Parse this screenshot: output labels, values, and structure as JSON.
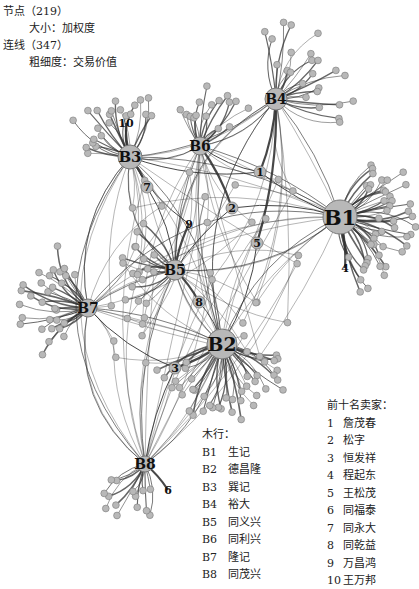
{
  "legend": {
    "nodes_label": "节点（219）",
    "node_size_label": "大小：加权度",
    "edges_label": "连线（347）",
    "edge_width_label": "粗细度：交易价值"
  },
  "firms": {
    "title": "木行：",
    "items": [
      {
        "code": "B1",
        "name": "生记"
      },
      {
        "code": "B2",
        "name": "德昌隆"
      },
      {
        "code": "B3",
        "name": "巽记"
      },
      {
        "code": "B4",
        "name": "裕大"
      },
      {
        "code": "B5",
        "name": "同义兴"
      },
      {
        "code": "B6",
        "name": "同利兴"
      },
      {
        "code": "B7",
        "name": "隆记"
      },
      {
        "code": "B8",
        "name": "同茂兴"
      }
    ]
  },
  "sellers": {
    "title": "前十名卖家：",
    "items": [
      {
        "code": "1",
        "name": "詹茂春"
      },
      {
        "code": "2",
        "name": "松字"
      },
      {
        "code": "3",
        "name": "恒发祥"
      },
      {
        "code": "4",
        "name": "程起东"
      },
      {
        "code": "5",
        "name": "王松茂"
      },
      {
        "code": "6",
        "name": "同福泰"
      },
      {
        "code": "7",
        "name": "同永大"
      },
      {
        "code": "8",
        "name": "同乾益"
      },
      {
        "code": "9",
        "name": "万昌鸿"
      },
      {
        "code": "10",
        "name": "王万邦"
      }
    ]
  },
  "network": {
    "node_fill": "#b8b8b8",
    "node_stroke": "#7a7a7a",
    "edge_color": "#333333",
    "hubs": [
      {
        "id": "B1",
        "x": 340,
        "y": 217,
        "r": 17
      },
      {
        "id": "B2",
        "x": 222,
        "y": 344,
        "r": 15
      },
      {
        "id": "B3",
        "x": 130,
        "y": 157,
        "r": 12
      },
      {
        "id": "B4",
        "x": 276,
        "y": 99,
        "r": 11
      },
      {
        "id": "B5",
        "x": 175,
        "y": 270,
        "r": 10
      },
      {
        "id": "B6",
        "x": 200,
        "y": 146,
        "r": 9
      },
      {
        "id": "B7",
        "x": 88,
        "y": 308,
        "r": 9
      },
      {
        "id": "B8",
        "x": 145,
        "y": 464,
        "r": 8
      }
    ],
    "top_sellers": [
      {
        "id": "1",
        "x": 260,
        "y": 172
      },
      {
        "id": "2",
        "x": 232,
        "y": 208
      },
      {
        "id": "3",
        "x": 175,
        "y": 368
      },
      {
        "id": "4",
        "x": 345,
        "y": 268
      },
      {
        "id": "5",
        "x": 257,
        "y": 243
      },
      {
        "id": "6",
        "x": 168,
        "y": 490
      },
      {
        "id": "7",
        "x": 147,
        "y": 187
      },
      {
        "id": "8",
        "x": 199,
        "y": 302
      },
      {
        "id": "9",
        "x": 189,
        "y": 224
      },
      {
        "id": "10",
        "x": 126,
        "y": 123
      }
    ]
  }
}
